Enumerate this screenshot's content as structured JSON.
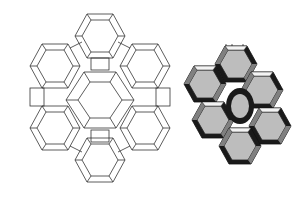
{
  "figure": {
    "left_panel": {
      "style": "wireframe",
      "stroke": "#333333",
      "fill": "#ffffff"
    },
    "right_panel": {
      "style": "shaded polyhedra",
      "colors": {
        "light": "#bdbdbd",
        "mid": "#808080",
        "dark": "#1a1a1a",
        "white": "#f4f4f4"
      }
    }
  }
}
